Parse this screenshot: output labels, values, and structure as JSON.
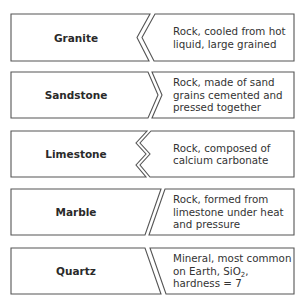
{
  "colors": {
    "border": "#555555",
    "text": "#333333",
    "background": "#ffffff"
  },
  "rows": [
    {
      "term": "Granite",
      "connector": "angle-left",
      "top": 14,
      "bottom": 61,
      "left_shape": [
        [
          11,
          14
        ],
        [
          150,
          14
        ],
        [
          137,
          37.5
        ],
        [
          149,
          61
        ],
        [
          11,
          61
        ]
      ],
      "right_shape": [
        [
          155,
          14
        ],
        [
          294,
          14
        ],
        [
          294,
          61
        ],
        [
          154,
          61
        ],
        [
          142,
          37.5
        ]
      ],
      "description_lines": [
        "Rock, cooled from hot",
        "liquid, large grained"
      ]
    },
    {
      "term": "Sandstone",
      "connector": "angle-right",
      "top": 72,
      "bottom": 118,
      "left_shape": [
        [
          11,
          72
        ],
        [
          148,
          72
        ],
        [
          158,
          95
        ],
        [
          148,
          118
        ],
        [
          11,
          118
        ]
      ],
      "right_shape": [
        [
          152,
          72
        ],
        [
          294,
          72
        ],
        [
          294,
          118
        ],
        [
          152,
          118
        ],
        [
          162,
          95
        ]
      ],
      "description_lines": [
        "Rock, made of sand",
        "grains cemented and",
        "pressed together"
      ]
    },
    {
      "term": "Limestone",
      "connector": "zigzag",
      "top": 131,
      "bottom": 177,
      "left_shape": [
        [
          11,
          131
        ],
        [
          147,
          131
        ],
        [
          136,
          143
        ],
        [
          146,
          154
        ],
        [
          136,
          165
        ],
        [
          146,
          177
        ],
        [
          11,
          177
        ]
      ],
      "right_shape": [
        [
          151,
          131
        ],
        [
          294,
          131
        ],
        [
          294,
          177
        ],
        [
          150,
          177
        ],
        [
          140,
          165
        ],
        [
          150,
          154
        ],
        [
          140,
          143
        ]
      ],
      "description_lines": [
        "Rock, composed of",
        "calcium carbonate"
      ]
    },
    {
      "term": "Marble",
      "connector": "slash",
      "top": 189,
      "bottom": 235,
      "left_shape": [
        [
          11,
          189
        ],
        [
          161,
          189
        ],
        [
          145,
          235
        ],
        [
          11,
          235
        ]
      ],
      "right_shape": [
        [
          165,
          189
        ],
        [
          294,
          189
        ],
        [
          294,
          235
        ],
        [
          149,
          235
        ]
      ],
      "description_lines": [
        "Rock, formed from",
        "limestone under heat",
        "and pressure"
      ]
    },
    {
      "term": "Quartz",
      "connector": "backslash",
      "top": 248,
      "bottom": 294,
      "left_shape": [
        [
          11,
          248
        ],
        [
          145,
          248
        ],
        [
          161,
          294
        ],
        [
          11,
          294
        ]
      ],
      "right_shape": [
        [
          150,
          248
        ],
        [
          294,
          248
        ],
        [
          294,
          294
        ],
        [
          166,
          294
        ]
      ],
      "description_lines": [
        "Mineral, most common",
        "on Earth, SiO",
        "hardness = 7"
      ],
      "subscript": {
        "line": 1,
        "text": "2",
        "suffix": ","
      }
    }
  ]
}
